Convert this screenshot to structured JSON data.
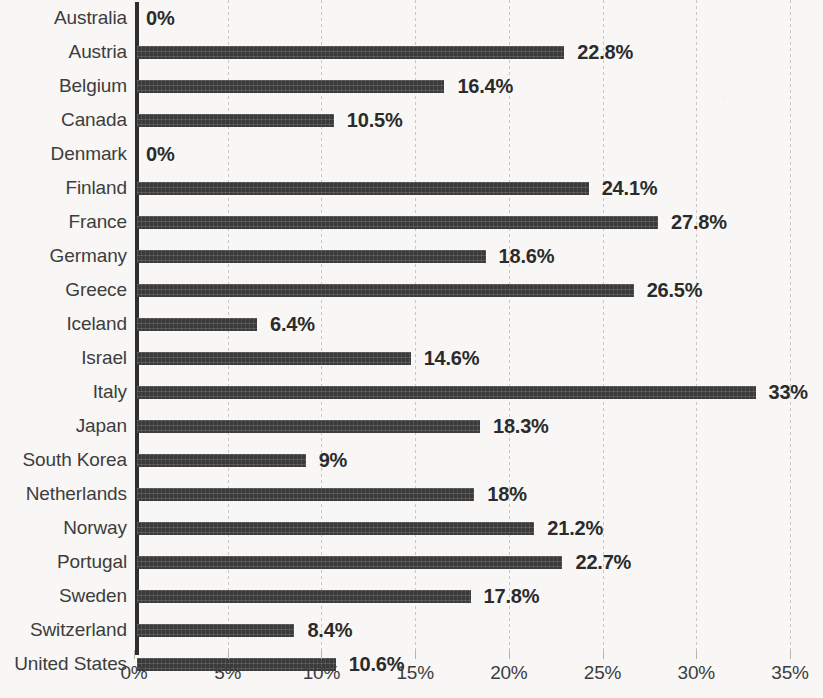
{
  "chart_data": {
    "type": "bar",
    "orientation": "horizontal",
    "title": "",
    "xlabel": "",
    "ylabel": "",
    "xlim": [
      0,
      35
    ],
    "xtick_labels": [
      "0%",
      "5%",
      "10%",
      "15%",
      "20%",
      "25%",
      "30%",
      "35%"
    ],
    "xtick_values": [
      0,
      5,
      10,
      15,
      20,
      25,
      30,
      35
    ],
    "grid": true,
    "grid_axis": "x",
    "legend": false,
    "bar_color": "#3a3a3a",
    "background_color": "#f8f7f5",
    "categories": [
      "Australia",
      "Austria",
      "Belgium",
      "Canada",
      "Denmark",
      "Finland",
      "France",
      "Germany",
      "Greece",
      "Iceland",
      "Israel",
      "Italy",
      "Japan",
      "South Korea",
      "Netherlands",
      "Norway",
      "Portugal",
      "Sweden",
      "Switzerland",
      "United States"
    ],
    "values": [
      0,
      22.8,
      16.4,
      10.5,
      0,
      24.1,
      27.8,
      18.6,
      26.5,
      6.4,
      14.6,
      33,
      18.3,
      9,
      18,
      21.2,
      22.7,
      17.8,
      8.4,
      10.6
    ],
    "data_labels": [
      "0%",
      "22.8%",
      "16.4%",
      "10.5%",
      "0%",
      "24.1%",
      "27.8%",
      "18.6%",
      "26.5%",
      "6.4%",
      "14.6%",
      "33%",
      "18.3%",
      "9%",
      "18%",
      "21.2%",
      "22.7%",
      "17.8%",
      "8.4%",
      "10.6%"
    ]
  }
}
